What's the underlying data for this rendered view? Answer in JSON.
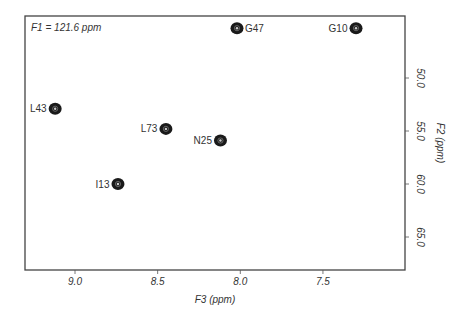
{
  "chart_data": {
    "type": "scatter",
    "title": "",
    "annotation": "F1 = 121.6 ppm",
    "xlabel": "F3 (ppm)",
    "ylabel": "F2 (ppm)",
    "xlim": [
      9.3,
      7.0
    ],
    "ylim": [
      43.5,
      68.0
    ],
    "x_reversed": true,
    "y_reversed": true,
    "grid": false,
    "x_ticks": [
      9.0,
      8.5,
      8.0,
      7.5
    ],
    "x_tick_labels": [
      "9.0",
      "8.5",
      "8.0",
      "7.5"
    ],
    "y_ticks": [
      50.0,
      55.0,
      60.0,
      65.0
    ],
    "y_tick_labels": [
      "50.0",
      "55.0",
      "60.0",
      "65.0"
    ],
    "y_axis_position": "right",
    "points": [
      {
        "label": "G47",
        "x": 8.02,
        "y": 45.3,
        "label_side": "right"
      },
      {
        "label": "G10",
        "x": 7.3,
        "y": 45.3,
        "label_side": "left"
      },
      {
        "label": "L43",
        "x": 9.12,
        "y": 52.9,
        "label_side": "left"
      },
      {
        "label": "L73",
        "x": 8.45,
        "y": 54.8,
        "label_side": "left"
      },
      {
        "label": "N25",
        "x": 8.12,
        "y": 55.9,
        "label_side": "left"
      },
      {
        "label": "I13",
        "x": 8.74,
        "y": 60.0,
        "label_side": "left"
      }
    ]
  },
  "frame": {
    "left": 25,
    "top": 16,
    "right": 405,
    "bottom": 270
  },
  "colors": {
    "axis": "#444444",
    "peak": "#1a1a1a",
    "peak_center": "#cccccc",
    "text": "#333333"
  }
}
